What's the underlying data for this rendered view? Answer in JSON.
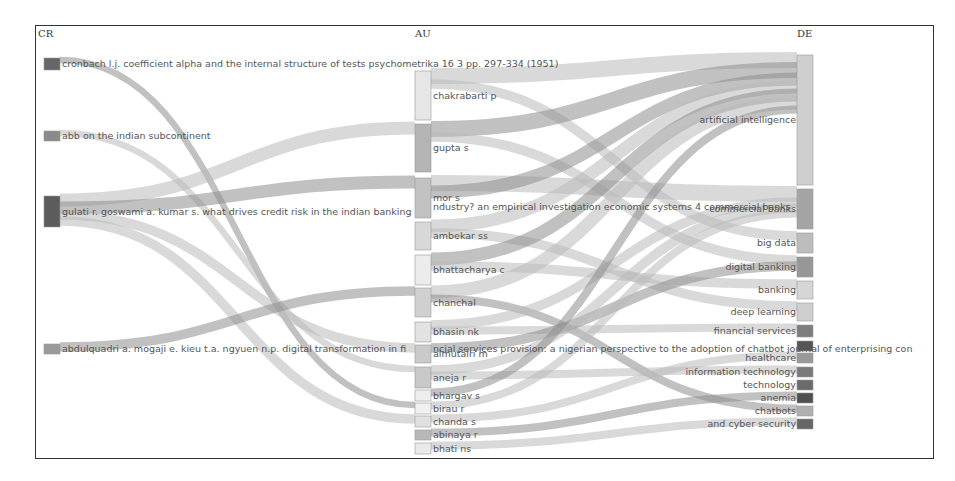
{
  "columns": {
    "left": "CR",
    "middle": "AU",
    "right": "DE"
  },
  "chart_data": {
    "type": "sankey",
    "fields": [
      "CR",
      "AU",
      "DE"
    ],
    "nodes": {
      "CR": [
        {
          "label": "cronbach l.j. coefficient alpha and the internal structure of tests psychometrika 16 3 pp. 297-334 (1951)",
          "y": 58,
          "h": 12,
          "color": "#666666"
        },
        {
          "label": "abb on the indian subcontinent",
          "y": 131,
          "h": 10,
          "color": "#8a8a8a"
        },
        {
          "label": "gulati r. goswami a. kumar s. what drives credit risk in the indian banking industry? an empirical investigation economic systems 4",
          "y": 196,
          "h": 31,
          "color": "#5c5c5c"
        },
        {
          "label": "abdulquadri a. mogaji e. kieu t.a. ngyuen n.p. digital transformation in financial services provision: a nigerian perspective to the adoption of chatbot journal of enterprising communities",
          "y": 344,
          "h": 10,
          "color": "#9a9a9a"
        }
      ],
      "AU": [
        {
          "label": "chakrabarti p",
          "y": 71,
          "h": 49,
          "color": "#e6e6e6"
        },
        {
          "label": "gupta s",
          "y": 124,
          "h": 48,
          "color": "#b4b4b4"
        },
        {
          "label": "mor s",
          "y": 178,
          "h": 40,
          "color": "#c2c2c2"
        },
        {
          "label": "ambekar ss",
          "y": 222,
          "h": 28,
          "color": "#d8d8d8"
        },
        {
          "label": "bhattacharya c",
          "y": 255,
          "h": 30,
          "color": "#ececec"
        },
        {
          "label": "chanchal",
          "y": 288,
          "h": 29,
          "color": "#d0d0d0"
        },
        {
          "label": "bhasin nk",
          "y": 322,
          "h": 20,
          "color": "#e2e2e2"
        },
        {
          "label": "almutairi m",
          "y": 345,
          "h": 18,
          "color": "#cacaca"
        },
        {
          "label": "aneja r",
          "y": 367,
          "h": 21,
          "color": "#c8c8c8"
        },
        {
          "label": "bhargav s",
          "y": 390,
          "h": 11,
          "color": "#eeeeee"
        },
        {
          "label": "birau r",
          "y": 403,
          "h": 11,
          "color": "#f0f0f0"
        },
        {
          "label": "chanda s",
          "y": 416,
          "h": 11,
          "color": "#e0e0e0"
        },
        {
          "label": "abinaya r",
          "y": 430,
          "h": 10,
          "color": "#b8b8b8"
        },
        {
          "label": "bhati ns",
          "y": 443,
          "h": 11,
          "color": "#eaeaea"
        }
      ],
      "DE": [
        {
          "label": "artificial intelligence",
          "y": 55,
          "h": 130,
          "color": "#cfcfcf"
        },
        {
          "label": "commercial banks",
          "y": 189,
          "h": 40,
          "color": "#a4a4a4"
        },
        {
          "label": "big data",
          "y": 233,
          "h": 20,
          "color": "#bdbdbd"
        },
        {
          "label": "digital banking",
          "y": 257,
          "h": 20,
          "color": "#979797"
        },
        {
          "label": "banking",
          "y": 281,
          "h": 18,
          "color": "#d6d6d6"
        },
        {
          "label": "deep learning",
          "y": 303,
          "h": 18,
          "color": "#cfcfcf"
        },
        {
          "label": "financial services",
          "y": 325,
          "h": 12,
          "color": "#7d7d7d"
        },
        {
          "label": "",
          "y": 341,
          "h": 10,
          "color": "#555555"
        },
        {
          "label": "healthcare",
          "y": 353,
          "h": 10,
          "color": "#999999"
        },
        {
          "label": "information technology",
          "y": 367,
          "h": 10,
          "color": "#7a7a7a"
        },
        {
          "label": "technology",
          "y": 380,
          "h": 10,
          "color": "#6b6b6b"
        },
        {
          "label": "anemia",
          "y": 393,
          "h": 10,
          "color": "#4f4f4f"
        },
        {
          "label": "chatbots",
          "y": 406,
          "h": 10,
          "color": "#b0b0b0"
        },
        {
          "label": "and cyber security",
          "y": 419,
          "h": 10,
          "color": "#666666"
        }
      ]
    },
    "links": [
      {
        "from": "CR:0",
        "to": "AU:10",
        "w": 4
      },
      {
        "from": "CR:1",
        "to": "AU:8",
        "w": 4
      },
      {
        "from": "CR:2",
        "to": "AU:1",
        "w": 8
      },
      {
        "from": "CR:2",
        "to": "AU:2",
        "w": 8
      },
      {
        "from": "CR:2",
        "to": "AU:7",
        "w": 6
      },
      {
        "from": "CR:2",
        "to": "AU:11",
        "w": 6
      },
      {
        "from": "CR:3",
        "to": "AU:5",
        "w": 6
      },
      {
        "from": "AU:0",
        "to": "DE:0",
        "w": 10
      },
      {
        "from": "AU:0",
        "to": "DE:2",
        "w": 6
      },
      {
        "from": "AU:1",
        "to": "DE:0",
        "w": 10
      },
      {
        "from": "AU:1",
        "to": "DE:3",
        "w": 6
      },
      {
        "from": "AU:2",
        "to": "DE:1",
        "w": 10
      },
      {
        "from": "AU:2",
        "to": "DE:0",
        "w": 8
      },
      {
        "from": "AU:3",
        "to": "DE:0",
        "w": 8
      },
      {
        "from": "AU:3",
        "to": "DE:5",
        "w": 6
      },
      {
        "from": "AU:4",
        "to": "DE:0",
        "w": 8
      },
      {
        "from": "AU:4",
        "to": "DE:4",
        "w": 6
      },
      {
        "from": "AU:5",
        "to": "DE:0",
        "w": 8
      },
      {
        "from": "AU:5",
        "to": "DE:12",
        "w": 5
      },
      {
        "from": "AU:6",
        "to": "DE:1",
        "w": 6
      },
      {
        "from": "AU:6",
        "to": "DE:6",
        "w": 5
      },
      {
        "from": "AU:7",
        "to": "DE:3",
        "w": 6
      },
      {
        "from": "AU:8",
        "to": "DE:1",
        "w": 6
      },
      {
        "from": "AU:8",
        "to": "DE:9",
        "w": 5
      },
      {
        "from": "AU:9",
        "to": "DE:0",
        "w": 5
      },
      {
        "from": "AU:10",
        "to": "DE:1",
        "w": 5
      },
      {
        "from": "AU:11",
        "to": "DE:8",
        "w": 5
      },
      {
        "from": "AU:12",
        "to": "DE:11",
        "w": 5
      },
      {
        "from": "AU:13",
        "to": "DE:13",
        "w": 5
      }
    ]
  },
  "overflow_labels": {
    "cr_gulati_tail": "ndustry? an empirical investigation economic systems 4 commercial banks",
    "cr_abdul_tail": "ncial services provision: a nigerian perspective to the adoption of chatbot journal of enterprising con"
  }
}
